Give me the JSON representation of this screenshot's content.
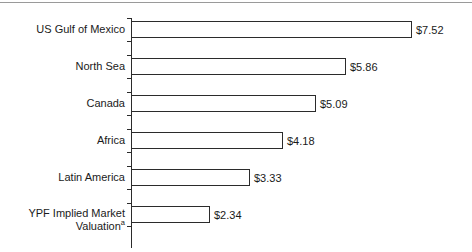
{
  "figure": {
    "background_color": "#ffffff",
    "axis_color": "#2b2b2b",
    "bar_fill_color": "#ffffff",
    "bar_edge_color": "#2b2b2b",
    "top_rule_color": "#9a9a9a",
    "text_color": "#1a1a1a"
  },
  "chart_data": {
    "type": "bar",
    "orientation": "horizontal",
    "title": "",
    "subtitle": "",
    "xlabel": "",
    "ylabel": "",
    "grid": false,
    "legend": null,
    "value_prefix": "$",
    "xlim": [
      0,
      7.52
    ],
    "categories": [
      "US Gulf of Mexico",
      "North Sea",
      "Canada",
      "Africa",
      "Latin America",
      "YPF Implied Market Valuation"
    ],
    "values": [
      7.52,
      5.86,
      5.09,
      4.18,
      3.33,
      2.34
    ],
    "data_labels": [
      "$7.52",
      "$5.86",
      "$5.09",
      "$4.18",
      "$3.33",
      "$2.34"
    ],
    "annotations": [
      {
        "category": "YPF Implied Market Valuation",
        "marker": "a",
        "type": "footnote-superscript"
      }
    ]
  },
  "rows": [
    {
      "label_line1": "US Gulf of Mexico",
      "label_line2": "",
      "superscript": "",
      "value": 7.52,
      "value_label": "$7.52",
      "bar_px": 281,
      "label_px": 416,
      "row_top": 21
    },
    {
      "label_line1": "North Sea",
      "label_line2": "",
      "superscript": "",
      "value": 5.86,
      "value_label": "$5.86",
      "bar_px": 215,
      "label_px": 350,
      "row_top": 58
    },
    {
      "label_line1": "Canada",
      "label_line2": "",
      "superscript": "",
      "value": 5.09,
      "value_label": "$5.09",
      "bar_px": 185,
      "label_px": 320,
      "row_top": 95
    },
    {
      "label_line1": "Africa",
      "label_line2": "",
      "superscript": "",
      "value": 4.18,
      "value_label": "$4.18",
      "bar_px": 152,
      "label_px": 287,
      "row_top": 132
    },
    {
      "label_line1": "Latin America",
      "label_line2": "",
      "superscript": "",
      "value": 3.33,
      "value_label": "$3.33",
      "bar_px": 119,
      "label_px": 254,
      "row_top": 169
    },
    {
      "label_line1": "YPF Implied Market",
      "label_line2": "Valuation",
      "superscript": "a",
      "value": 2.34,
      "value_label": "$2.34",
      "bar_px": 79,
      "label_px": 214,
      "row_top": 206
    }
  ]
}
